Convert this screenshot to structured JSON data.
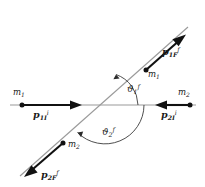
{
  "figure": {
    "type": "physics-collision-diagram",
    "background_color": "#ffffff",
    "stroke_color": "#1a1a1a",
    "axis_color": "#8c8c8c"
  },
  "masses": {
    "incoming_1": {
      "symbol": "m",
      "sub": "1"
    },
    "incoming_2": {
      "symbol": "m",
      "sub": "2"
    },
    "outgoing_1": {
      "symbol": "m",
      "sub": "1"
    },
    "outgoing_2": {
      "symbol": "m",
      "sub": "2"
    }
  },
  "momenta": {
    "p1i": {
      "symbol": "p",
      "sub": "1I",
      "sup": "i"
    },
    "p2i": {
      "symbol": "p",
      "sub": "2I",
      "sup": "i"
    },
    "p1f": {
      "symbol": "p",
      "sub": "1F",
      "sup": "f"
    },
    "p2f": {
      "symbol": "p",
      "sub": "2F",
      "sup": "f"
    }
  },
  "angles": {
    "theta1": {
      "symbol": "ϑ",
      "sub": "1",
      "sup": "f"
    },
    "theta2": {
      "symbol": "ϑ",
      "sub": "2",
      "sup": "f"
    }
  },
  "geometry": {
    "origin": {
      "x": 105,
      "y": 105
    },
    "axis_left_end": {
      "x": 10,
      "y": 105
    },
    "axis_right_end": {
      "x": 196,
      "y": 105
    },
    "diagonal_upper_end": {
      "x": 188,
      "y": 27
    },
    "diagonal_lower_end": {
      "x": 20,
      "y": 176
    },
    "theta1_degrees": 41,
    "theta2_degrees": 222
  }
}
